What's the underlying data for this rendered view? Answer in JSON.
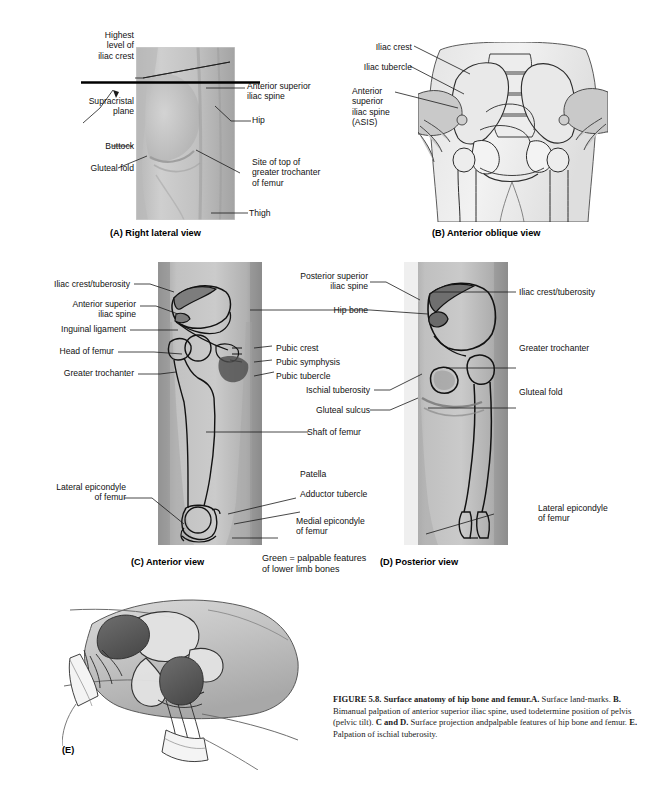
{
  "figure": {
    "number": "FIGURE 5.8.",
    "title": "Surface anatomy of hip bone and femur.",
    "body_a": "A.",
    "body_a_text": " Surface land-",
    "line2_pre": "marks. ",
    "line2_b": "B.",
    "line2_text": " Bimanual palpation of anterior superior iliac spine, used to",
    "line3_pre": "determine position of pelvis (pelvic tilt). ",
    "line3_b": "C and D.",
    "line3_text": " Surface projection and",
    "line4_pre": "palpable features of hip bone and femur. ",
    "line4_b": "E.",
    "line4_text": " Palpation of ischial tuberosity."
  },
  "panelA": {
    "caption": "(A) Right lateral view",
    "labels": {
      "highest_level": "Highest\nlevel of\niliac crest",
      "supracristal": "Supracristal\nplane",
      "buttock": "Buttock",
      "gluteal_fold": "Gluteal fold",
      "asis": "Anterior superior\niliac spine",
      "hip": "Hip",
      "greater_trochanter": "Site of top of\ngreater trochanter\nof femur",
      "thigh": "Thigh"
    }
  },
  "panelB": {
    "caption": "(B) Anterior oblique view",
    "labels": {
      "iliac_crest": "Iliac crest",
      "iliac_tubercle": "Iliac tubercle",
      "asis": "Anterior\nsuperior\niliac spine\n(ASIS)"
    }
  },
  "panelC": {
    "caption": "(C) Anterior view",
    "labels": {
      "iliac_crest_tuberosity": "Iliac crest/tuberosity",
      "asis": "Anterior superior\niliac spine",
      "inguinal_ligament": "Inguinal ligament",
      "head_of_femur": "Head of femur",
      "greater_trochanter": "Greater trochanter",
      "lateral_epicondyle": "Lateral epicondyle\nof femur",
      "pubic_crest": "Pubic crest",
      "pubic_symphysis": "Pubic symphysis",
      "pubic_tubercle": "Pubic tubercle",
      "shaft_of_femur": "Shaft of femur",
      "patella": "Patella",
      "adductor_tubercle": "Adductor tubercle",
      "medial_epicondyle": "Medial epicondyle\nof femur"
    }
  },
  "panelD": {
    "caption": "(D) Posterior view",
    "labels": {
      "psis": "Posterior superior\niliac spine",
      "hip_bone": "Hip bone",
      "ischial_tuberosity": "Ischial tuberosity",
      "gluteal_sulcus": "Gluteal sulcus",
      "iliac_crest_tuberosity": "Iliac crest/tuberosity",
      "greater_trochanter": "Greater trochanter",
      "gluteal_fold": "Gluteal fold",
      "lateral_epicondyle": "Lateral epicondyle\nof femur"
    }
  },
  "panelE": {
    "caption": "(E)"
  },
  "legend": {
    "text": "Green = palpable features\nof lower limb bones"
  },
  "colors": {
    "skin_light": "#c9c9c9",
    "skin_mid": "#b0b0b0",
    "skin_dark": "#8f8f8f",
    "bone_outline": "#111111",
    "palpable_fill": "#7b7b7b",
    "glove_dark": "#5d5d5d",
    "line": "#1a1a1a"
  }
}
